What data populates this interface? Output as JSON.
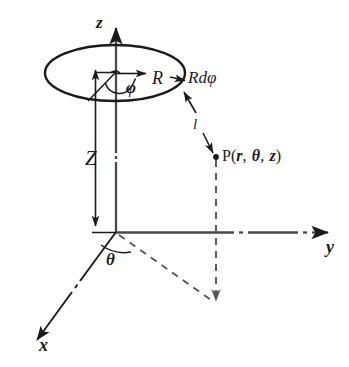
{
  "figure": {
    "colors": {
      "line": "#1a1a1a",
      "axis": "#4a4a4a",
      "dashed": "#555555",
      "background": "#ffffff"
    }
  },
  "axes": [
    {
      "name": "z-axis",
      "label": "z",
      "direction": "up"
    },
    {
      "name": "y-axis",
      "label": "y",
      "direction": "right"
    },
    {
      "name": "x-axis",
      "label": "x",
      "direction": "down-left"
    }
  ],
  "labels": {
    "z_axis": "z",
    "y_axis": "y",
    "x_axis": "x",
    "height": "Z",
    "ring_angle": "φ",
    "ring_radius": "R",
    "arc_element": "Rdφ",
    "azimuth_angle": "θ",
    "distance": "l",
    "point_prefix": "P",
    "point_open": "(",
    "point_r": "r",
    "point_comma1": ",",
    "point_theta": "θ",
    "point_comma2": ",",
    "point_z": "z",
    "point_close": ")",
    "point_full": "P(r, θ, z)"
  },
  "elements": [
    {
      "name": "source-ring",
      "kind": "ellipse",
      "note": "circular current loop of radius R seen in perspective"
    },
    {
      "name": "ring-center-marker",
      "kind": "point"
    },
    {
      "name": "height-arrow",
      "kind": "double-arrow",
      "label": "Z"
    },
    {
      "name": "radius-arrow",
      "kind": "arrow",
      "label": "R"
    },
    {
      "name": "phi-arc",
      "kind": "arc",
      "label": "φ"
    },
    {
      "name": "arc-element-pointer",
      "kind": "arrow",
      "label": "Rdφ"
    },
    {
      "name": "distance-arrow",
      "kind": "double-arrow",
      "label": "l"
    },
    {
      "name": "field-point",
      "kind": "point",
      "label": "P(r, θ, z)"
    },
    {
      "name": "theta-arc",
      "kind": "arc",
      "label": "θ"
    },
    {
      "name": "projection-vertical",
      "kind": "dashed-line"
    },
    {
      "name": "projection-radial",
      "kind": "dashed-line"
    }
  ]
}
